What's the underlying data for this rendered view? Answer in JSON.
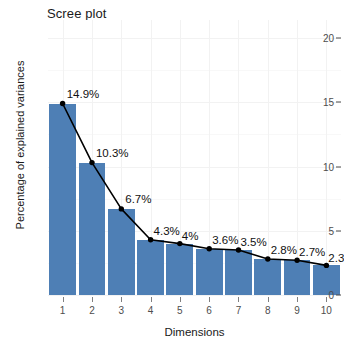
{
  "chart_data": {
    "type": "bar",
    "title": "Scree plot",
    "xlabel": "Dimensions",
    "ylabel": "Percentage of explained variances",
    "categories": [
      "1",
      "2",
      "3",
      "4",
      "5",
      "6",
      "7",
      "8",
      "9",
      "10"
    ],
    "values": [
      14.9,
      10.3,
      6.7,
      4.3,
      4.0,
      3.6,
      3.5,
      2.8,
      2.7,
      2.3
    ],
    "point_labels": [
      "14.9%",
      "10.3%",
      "6.7%",
      "4.3%",
      "4%",
      "3.6%",
      "3.5%",
      "2.8%",
      "2.7%",
      "2.3"
    ],
    "ylim": [
      0,
      21.5
    ],
    "y_ticks": [
      0,
      5,
      10,
      15,
      20
    ],
    "y_tick_labels": [
      "0",
      "5",
      "10",
      "15",
      "20"
    ],
    "x_ticks": [
      1,
      2,
      3,
      4,
      5,
      6,
      7,
      8,
      9,
      10
    ],
    "grid": true,
    "legend": "none",
    "series": [
      {
        "name": "percentage of explained variances",
        "values": [
          14.9,
          10.3,
          6.7,
          4.3,
          4.0,
          3.6,
          3.5,
          2.8,
          2.7,
          2.3
        ]
      }
    ],
    "colors": {
      "bar_fill": "#4E7FB5",
      "line": "#000000",
      "point": "#000000",
      "background": "#FFFFFF",
      "grid": "#F2F2F2",
      "axis_text": "#4D4D4D",
      "title_text": "#1A1A1A"
    }
  }
}
